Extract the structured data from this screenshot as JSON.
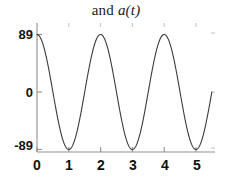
{
  "chart_data": {
    "type": "line",
    "title": "and a(t)",
    "title_prefix": "and ",
    "title_math": "a(t)",
    "xlabel": "",
    "ylabel": "",
    "xlim": [
      0,
      5.6
    ],
    "ylim": [
      -110,
      110
    ],
    "grid": false,
    "legend": null,
    "x_ticks": [
      0,
      1,
      2,
      3,
      4,
      5
    ],
    "x_tick_labels": [
      "0",
      "1",
      "2",
      "3",
      "4",
      "5"
    ],
    "y_ticks": [
      -89,
      0,
      89
    ],
    "y_tick_labels": [
      "-89",
      "0",
      "89"
    ],
    "series": [
      {
        "name": "a(t)",
        "formula": "89*cos(pi*t)",
        "amplitude": 89,
        "period": 2,
        "color": "#3a3a3a",
        "linewidth": 1,
        "x": [
          0,
          0.1,
          0.2,
          0.3,
          0.4,
          0.5,
          0.6,
          0.7,
          0.8,
          0.9,
          1.0,
          1.1,
          1.2,
          1.3,
          1.4,
          1.5,
          1.6,
          1.7,
          1.8,
          1.9,
          2.0,
          2.1,
          2.2,
          2.3,
          2.4,
          2.5,
          2.6,
          2.7,
          2.8,
          2.9,
          3.0,
          3.1,
          3.2,
          3.3,
          3.4,
          3.5,
          3.6,
          3.7,
          3.8,
          3.9,
          4.0,
          4.1,
          4.2,
          4.3,
          4.4,
          4.5,
          4.6,
          4.7,
          4.8,
          4.9,
          5.0,
          5.1,
          5.2,
          5.3,
          5.4,
          5.5
        ],
        "y": [
          89,
          84.6,
          72.0,
          52.3,
          27.5,
          0,
          -27.5,
          -52.3,
          -72.0,
          -84.6,
          -89,
          -84.6,
          -72.0,
          -52.3,
          -27.5,
          0,
          27.5,
          52.3,
          72.0,
          84.6,
          89,
          84.6,
          72.0,
          52.3,
          27.5,
          0,
          -27.5,
          -52.3,
          -72.0,
          -84.6,
          -89,
          -84.6,
          -72.0,
          -52.3,
          -27.5,
          0,
          27.5,
          52.3,
          72.0,
          84.6,
          89,
          84.6,
          72.0,
          52.3,
          27.5,
          0,
          -27.5,
          -52.3,
          -72.0,
          -84.6,
          -89,
          -84.6,
          -72.0,
          -52.3,
          -27.5,
          0
        ]
      }
    ],
    "axis_color": "#808080",
    "background": "#ffffff"
  },
  "axes": {
    "y_labels": [
      {
        "text": "89",
        "top": 27
      },
      {
        "text": "0",
        "top": 85
      },
      {
        "text": "-89",
        "top": 138
      }
    ],
    "x_labels": [
      {
        "text": "0",
        "left": 28
      },
      {
        "text": "1",
        "left": 60
      },
      {
        "text": "2",
        "left": 92
      },
      {
        "text": "3",
        "left": 125
      },
      {
        "text": "4",
        "left": 157
      },
      {
        "text": "5",
        "left": 189
      }
    ]
  }
}
